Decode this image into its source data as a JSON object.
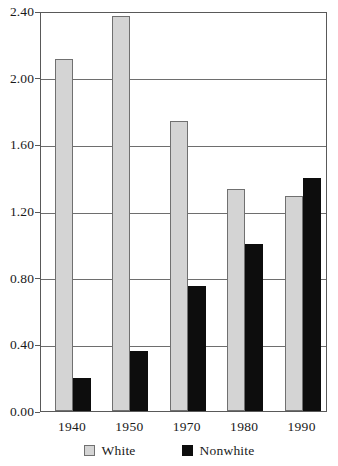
{
  "chart_data": {
    "type": "bar",
    "title": "",
    "subtitle": "",
    "xlabel": "",
    "ylabel": "",
    "categories": [
      "1940",
      "1950",
      "1970",
      "1980",
      "1990"
    ],
    "series": [
      {
        "name": "White",
        "color": "#d4d4d4",
        "values": [
          2.11,
          2.37,
          1.74,
          1.33,
          1.29
        ]
      },
      {
        "name": "Nonwhite",
        "color": "#0d0d0d",
        "values": [
          0.2,
          0.36,
          0.75,
          1.0,
          1.4
        ]
      }
    ],
    "ylim": [
      0.0,
      2.4
    ],
    "ytick_values": [
      0.0,
      0.4,
      0.8,
      1.2,
      1.6,
      2.0,
      2.4
    ],
    "ytick_labels": [
      "0.00",
      "0.40",
      "0.80",
      "1.20",
      "1.60",
      "2.00",
      "2.40"
    ],
    "grid": "horizontal",
    "legend_position": "bottom-center",
    "annotations": []
  },
  "legend": {
    "entries": [
      {
        "label": "White",
        "swatch": "light-gray-square"
      },
      {
        "label": "Nonwhite",
        "swatch": "black-square"
      }
    ]
  }
}
